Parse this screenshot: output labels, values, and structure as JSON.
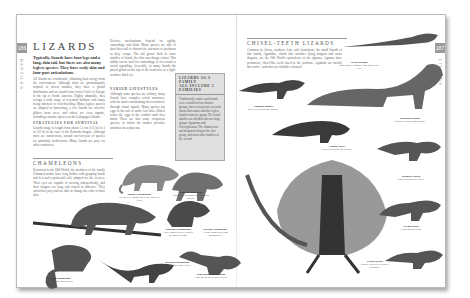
{
  "left_page": {
    "page_number": "186",
    "side_label": "REPTILES",
    "title": "LIZARDS",
    "intro": "Typically, lizards have four legs and a long, thin tail, but there are also many legless species. They have scaly skin and four-part articulations.",
    "body_paragraphs": [
      "All lizards are ectothermic, obtaining heat energy from the environment. Although most are predominantly tropical or desert animals, they have a global distribution and are found from Arctic Circle to Europe to the tip of South America. Highly adaptable, they occupy a wide range of terrestrial habitats with many being arboreal or rock-dwelling. Many legless species are adapted to burrowing, a few lizards are effective gliders from trees, and others are even aquatic, including a marine species on the Galapagos Islands.",
      "Lizards range in length from about 1.5 cm (1/2 in) to 3 m (10 ft) in the case of the Komodo dragon. Although most are carnivorous, around one-ten-year of species are primarily herbivorous. Many lizards are prey for other carnivores.",
      "Defence mechanisms depend on agility, camouflage and bluff. Many species are able to shed their tail to distract the attention of predators as they escape. The tail grows back in some families of lizard, the skin can change colour. This ability can be used for camouflage or for sexual or social signalling. Generally, in many lizards the pineal gland on the top of the head acts as a light-sensitive third eye.",
      "Although some species are solitary, many lizards have complex social structures, with the males maintaining their territories through visual signals. Many species lay eggs in the soil or under leaf litter. Others retain the eggs in the oviduct until they hatch. There are also some viviparous species, in which the mother provides nutrition via a placenta."
    ],
    "sub_headings": [
      "STRATEGIES FOR SURVIVAL",
      "VARIED LIFESTYLES"
    ],
    "infobox": {
      "title": "LIZARDS AS A FAMILY",
      "subtitle": "ALL INCLUDE 5 FAMILIES",
      "body": "Traditionally, snakes and lizards were considered two distinct groups, but recent genetic research shows that snakes and the legless lizards form one group. The lizard families are divided into two large groups: Iguanians and Scleroglossans. The chameleons and dragons belong to the first group, and most other families to the second."
    },
    "section_heading": "CHAMELEONS",
    "section_text": "Restricted to the Old World, the members of the family Chamaeleonidae have long bodies with grasping hands and feet and a prehensile tail, adapted for life in trees. Their eyes are capable of moving independently, and their tongues are long and coated in adhesive. They catch their prey and are able to change the color of their skin."
  },
  "right_page": {
    "page_number": "187",
    "side_label": "LIZARDS",
    "section_heading": "CHISEL-TEETH LIZARDS",
    "section_text": "Common in Africa, southern Asia, and Australasia, the small lizards of this family Agamidae, which also includes flying dragons and water dragons, are the Old World equivalents of the iguanas. Agamas have prominent, chisel-like teeth fused to the jawbone. Agamids are mostly day-active, and often are brightly coloured."
  },
  "captions": [
    {
      "name": "Meller's chameleon",
      "latin": "Chamaeleo melleri",
      "text": "The Meller's chameleon is the largest in Africa."
    },
    {
      "name": "Panther chameleon",
      "latin": "Furcifer pardalis",
      "text": "Males vary in colour depending on locality."
    },
    {
      "name": "Jackson's chameleon",
      "latin": "Chamaeleo jacksonii",
      "text": "Three-horned species, males use horns to fight."
    },
    {
      "name": "Parson's chameleon",
      "latin": "Calumma parsonii",
      "text": "A large chameleon from Madagascar."
    },
    {
      "name": "Veiled chameleon",
      "latin": "Chamaeleo calyptratus",
      "text": "A tall casque on the head."
    },
    {
      "name": "Graceful chameleon",
      "latin": "Chamaeleo gracilis",
      "text": "Widespread across Africa."
    },
    {
      "name": "Flap-necked chameleon",
      "latin": "Chamaeleo dilepis",
      "text": "Flaps on the neck can be raised."
    },
    {
      "name": "Frilled lizard",
      "latin": "Chlamydosaurus kingii",
      "text": "Raises a neck frill to scare predators."
    },
    {
      "name": "Water dragon",
      "latin": "Physignathus cocincinus",
      "text": "Semi-aquatic agamid from South-east Asia."
    },
    {
      "name": "Thorny devil",
      "latin": "Moloch horridus",
      "text": "Covered in spines for defence."
    },
    {
      "name": "Common agama",
      "latin": "Agama agama",
      "text": "Males develop bright colours."
    },
    {
      "name": "Bearded dragon",
      "latin": "Pogona vitticeps",
      "text": "Inflates a spiny throat pouch."
    },
    {
      "name": "Rainbow lizard",
      "latin": "Agama agama",
      "text": "Rocky habitats in Africa."
    },
    {
      "name": "Flying lizard",
      "latin": "Draco volans",
      "text": "Glides on skin flaps."
    }
  ]
}
